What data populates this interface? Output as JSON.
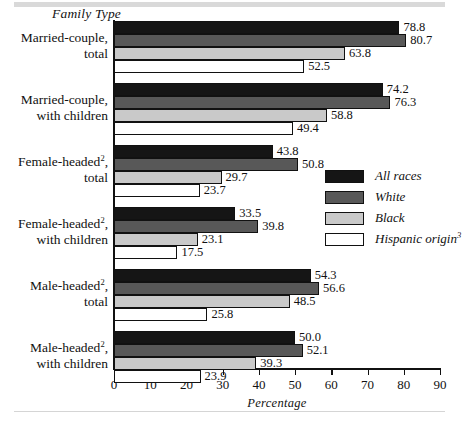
{
  "chart_data": {
    "type": "bar",
    "orientation": "horizontal",
    "title": "",
    "xlabel": "Percentage",
    "ylabel": "Family Type",
    "xlim": [
      0,
      90
    ],
    "xticks": [
      0,
      10,
      20,
      30,
      40,
      50,
      60,
      70,
      80,
      90
    ],
    "grid": false,
    "legend_position": "middle-right",
    "categories": [
      "Married-couple, total",
      "Married-couple, with children",
      "Female-headed², total",
      "Female-headed², with children",
      "Male-headed², total",
      "Male-headed², with children"
    ],
    "series": [
      {
        "name": "All races",
        "color": "#151515",
        "values": [
          78.8,
          74.2,
          43.8,
          33.5,
          54.3,
          50.0
        ]
      },
      {
        "name": "White",
        "color": "#585858",
        "values": [
          80.7,
          76.3,
          50.8,
          39.8,
          56.6,
          52.1
        ]
      },
      {
        "name": "Black",
        "color": "#c9c9c9",
        "values": [
          63.8,
          58.8,
          29.7,
          23.1,
          48.5,
          39.3
        ]
      },
      {
        "name": "Hispanic origin³",
        "color": "#ffffff",
        "values": [
          52.5,
          49.4,
          23.7,
          17.5,
          25.8,
          23.9
        ]
      }
    ]
  },
  "axis": {
    "y_title": "Family Type",
    "x_title": "Percentage",
    "tick_labels": [
      "0",
      "10",
      "20",
      "30",
      "40",
      "50",
      "60",
      "70",
      "80",
      "90"
    ]
  },
  "category_labels": [
    {
      "line1": "Married-couple,",
      "line2": "total",
      "sup1": ""
    },
    {
      "line1": "Married-couple,",
      "line2": "with children",
      "sup1": ""
    },
    {
      "line1": "Female-headed",
      "sup1": "2",
      "line1_tail": ",",
      "line2": "total"
    },
    {
      "line1": "Female-headed",
      "sup1": "2",
      "line1_tail": ",",
      "line2": "with children"
    },
    {
      "line1": "Male-headed",
      "sup1": "2",
      "line1_tail": ",",
      "line2": "total"
    },
    {
      "line1": "Male-headed",
      "sup1": "2",
      "line1_tail": ",",
      "line2": "with children"
    }
  ],
  "legend": [
    {
      "label": "All races",
      "sup": ""
    },
    {
      "label": "White",
      "sup": ""
    },
    {
      "label": "Black",
      "sup": ""
    },
    {
      "label": "Hispanic origin",
      "sup": "3"
    }
  ],
  "bar_value_labels": [
    [
      "78.8",
      "80.7",
      "63.8",
      "52.5"
    ],
    [
      "74.2",
      "76.3",
      "58.8",
      "49.4"
    ],
    [
      "43.8",
      "50.8",
      "29.7",
      "23.7"
    ],
    [
      "33.5",
      "39.8",
      "23.1",
      "17.5"
    ],
    [
      "54.3",
      "56.6",
      "48.5",
      "25.8"
    ],
    [
      "50.0",
      "52.1",
      "39.3",
      "23.9"
    ]
  ]
}
